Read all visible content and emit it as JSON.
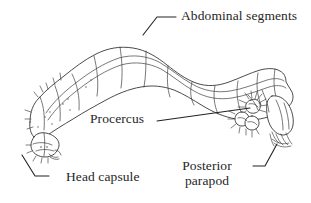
{
  "figure": {
    "background_color": "#ffffff",
    "ink_color": "#222222",
    "orientation": "head at lower left, posterior at right"
  },
  "labels": {
    "abdominal_segments": "Abdominal segments",
    "procercus": "Procercus",
    "head_capsule": "Head capsule",
    "posterior_parapod_line1": "Posterior",
    "posterior_parapod_line2": "parapod"
  },
  "leaders": [
    {
      "name": "abdominal-segments-leader",
      "for": "Abdominal segments",
      "points": "143,35 157,17 176,17"
    },
    {
      "name": "procercus-leader",
      "for": "Procercus",
      "points": "157,121 250,108"
    },
    {
      "name": "head-capsule-leader",
      "for": "Head capsule",
      "points": "22,155 35,176 49,176"
    },
    {
      "name": "posterior-parapod-leader",
      "for": "Posterior parapod",
      "points": "253,166 265,166 277,144"
    }
  ],
  "anatomy_parts": [
    "head capsule",
    "thoracic segments",
    "abdominal segments",
    "procercus",
    "posterior parapod",
    "anal tubules",
    "setae"
  ]
}
